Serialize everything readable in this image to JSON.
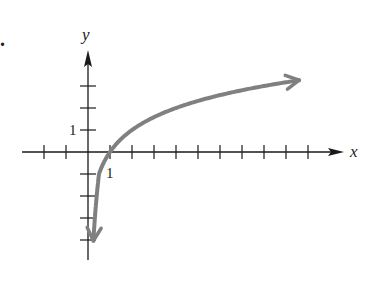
{
  "figure_label": ".",
  "chart_data": {
    "type": "line",
    "title": "",
    "function": "y = log2(x)",
    "xlabel": "x",
    "ylabel": "y",
    "xlim": [
      -3,
      11.5
    ],
    "ylim": [
      -5,
      4.5
    ],
    "x_tick_step": 1,
    "y_tick_step": 1,
    "x_tick_labels": [
      {
        "value": 1,
        "label": "1"
      }
    ],
    "y_tick_labels": [
      {
        "value": 1,
        "label": "1"
      }
    ],
    "grid": false,
    "series": [
      {
        "name": "curve",
        "color": "#808080",
        "arrows": "both",
        "x": [
          0.23,
          0.25,
          0.5,
          1,
          2,
          4,
          8,
          9.6
        ],
        "y": [
          -3.9,
          -2,
          -1,
          0,
          1,
          2,
          3,
          3.26
        ]
      }
    ]
  },
  "style": {
    "axis_color": "#1a1a1a",
    "curve_color": "#808080"
  }
}
